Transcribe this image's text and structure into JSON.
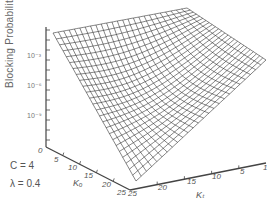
{
  "chart_data": {
    "type": "surface3d",
    "title": "",
    "zlabel": "Blocking Probability",
    "z_scale": "log",
    "z_ticks": [
      "10^-3",
      "10^-6",
      "10^-9"
    ],
    "x_axis": {
      "label": "Ko",
      "ticks": [
        "0",
        "5",
        "10",
        "15",
        "20",
        "25"
      ],
      "range": [
        0,
        25
      ]
    },
    "y_axis": {
      "label": "Kt",
      "ticks": [
        "25",
        "20",
        "15",
        "10",
        "5",
        "1"
      ],
      "range": [
        1,
        25
      ]
    },
    "annotations": [
      "C = 4",
      "λ = 0.4"
    ],
    "parameters": {
      "C": 4,
      "lambda": 0.4
    },
    "grid_resolution": [
      25,
      25
    ],
    "corner_heights_log10": {
      "Ko0_Kt1": -0.5,
      "Ko0_Kt25": -0.3,
      "Ko25_Kt1": -3.0,
      "Ko25_Kt25": -11.0
    },
    "grid": "on",
    "legend": "none"
  },
  "labels": {
    "y_axis_title": "Blocking Probability",
    "y_ticks": [
      {
        "text": "10⁻³",
        "top": 52
      },
      {
        "text": "10⁻⁶",
        "top": 82
      },
      {
        "text": "10⁻⁹",
        "top": 112
      }
    ],
    "left_axis_ticks": [
      {
        "text": "0",
        "x": 38,
        "y": 146
      },
      {
        "text": "5",
        "x": 54,
        "y": 155
      },
      {
        "text": "10",
        "x": 68,
        "y": 163
      },
      {
        "text": "15",
        "x": 84,
        "y": 171
      },
      {
        "text": "20",
        "x": 102,
        "y": 180
      },
      {
        "text": "25",
        "x": 117,
        "y": 188
      }
    ],
    "right_axis_ticks": [
      {
        "text": "25",
        "x": 128,
        "y": 189
      },
      {
        "text": "20",
        "x": 158,
        "y": 183
      },
      {
        "text": "15",
        "x": 187,
        "y": 177
      },
      {
        "text": "10",
        "x": 212,
        "y": 172
      },
      {
        "text": "5",
        "x": 240,
        "y": 167
      },
      {
        "text": "1",
        "x": 263,
        "y": 163
      }
    ],
    "left_axis_name": "Kₒ",
    "right_axis_name": "Kₜ",
    "annotation_c": "C = 4",
    "annotation_lambda": "λ = 0.4"
  },
  "geometry": {
    "z_axis": {
      "x": 46,
      "top": 27,
      "bottom": 147
    },
    "left_axis_end": [
      130,
      190
    ],
    "right_axis_end": [
      266,
      163
    ],
    "surface": {
      "far": [
        53,
        33
      ],
      "top_right": [
        187,
        8
      ],
      "right": [
        266,
        60
      ],
      "bottom": [
        136,
        181
      ]
    }
  }
}
